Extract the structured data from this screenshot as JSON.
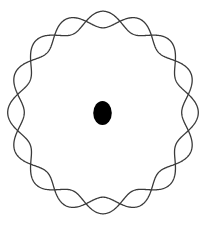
{
  "diagram": {
    "type": "standing-wave-on-circular-orbit",
    "width": 211,
    "height": 226,
    "background": "#ffffff",
    "orbit": {
      "center": [
        103,
        112.5
      ],
      "radius_x": 87,
      "radius_y": 93,
      "wavelengths": 8,
      "amplitude": 8.3,
      "phase_deg": 90,
      "strands": [
        {
          "name": "wave-strand-1",
          "sign": 1
        },
        {
          "name": "wave-strand-2",
          "sign": -1
        }
      ],
      "stroke_color": "#3a3a3a",
      "stroke_width": 1.3
    },
    "nucleus": {
      "center": [
        102.5,
        113
      ],
      "radius_x": 9.3,
      "radius_y": 12,
      "fill": "#000000"
    }
  }
}
